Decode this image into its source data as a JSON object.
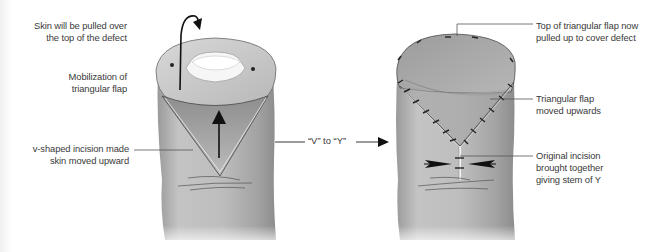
{
  "diagram": {
    "transition_label": "“V” to “Y”",
    "left_panel": {
      "name": "before",
      "labels": [
        {
          "id": "skin-pulled",
          "text": "Skin will be pulled over\nthe top of the defect"
        },
        {
          "id": "mobilization",
          "text": "Mobilization of\ntriangular flap"
        },
        {
          "id": "v-incision",
          "text": "v-shaped incision made\nskin moved upward"
        }
      ]
    },
    "right_panel": {
      "name": "after",
      "labels": [
        {
          "id": "top-flap",
          "text": "Top of triangular flap now\npulled up to cover defect"
        },
        {
          "id": "flap-moved",
          "text": "Triangular flap\nmoved upwards"
        },
        {
          "id": "original-incision",
          "text": "Original incision\nbrought together\ngiving stem of Y"
        }
      ]
    },
    "colors": {
      "text": "#3a3a3a",
      "leader_line": "#555555",
      "skin_light": "#d6d6d6",
      "skin_mid": "#b4b4b4",
      "skin_dark": "#8a8a8a",
      "flap": "#a8a8a8",
      "defect": "#f4f4f4",
      "arrow": "#111111"
    }
  }
}
